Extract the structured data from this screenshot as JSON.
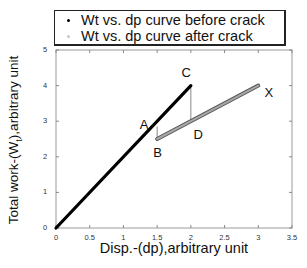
{
  "chart_data": {
    "type": "line",
    "title": "",
    "xlabel": "Disp.-(dp),arbitrary unit",
    "ylabel": "Total work-(Wₜ),arbitrary unit",
    "xlim": [
      0,
      3.5
    ],
    "ylim": [
      0,
      5
    ],
    "xticks": [
      "0",
      "0.5",
      "1",
      "1.5",
      "2",
      "2.5",
      "3",
      "3.5"
    ],
    "yticks": [
      "0",
      "1",
      "2",
      "3",
      "4",
      "5"
    ],
    "grid": false,
    "legend_position": "top, above plot",
    "series": [
      {
        "name": "Wt vs. dp curve before crack",
        "color": "#000000",
        "x": [
          0,
          2.0
        ],
        "y": [
          0,
          4.0
        ]
      },
      {
        "name": "Wt vs. dp curve after crack",
        "color": "#888888",
        "x": [
          1.5,
          3.0
        ],
        "y": [
          2.5,
          4.0
        ]
      }
    ],
    "reference_lines": [
      {
        "name": "B vertical",
        "x": [
          1.5,
          1.5
        ],
        "y": [
          2.5,
          2.85
        ]
      },
      {
        "name": "C-D vertical",
        "x": [
          2.0,
          2.0
        ],
        "y": [
          4.0,
          3.0
        ]
      }
    ],
    "annotations": [
      {
        "text": "A",
        "x": 1.3,
        "y": 2.9
      },
      {
        "text": "B",
        "x": 1.5,
        "y": 2.1
      },
      {
        "text": "C",
        "x": 1.92,
        "y": 4.35
      },
      {
        "text": "D",
        "x": 2.1,
        "y": 2.6
      },
      {
        "text": "X",
        "x": 3.15,
        "y": 3.8
      }
    ]
  },
  "legend": {
    "items": [
      {
        "label": "Wt vs. dp curve before crack",
        "color": "#000000"
      },
      {
        "label": "Wt vs. dp curve after crack",
        "color": "#c8c8c8"
      }
    ]
  },
  "axes": {
    "xlabel": "Disp.-(dp),arbitrary unit",
    "ylabel_main": "Total work-(W",
    "ylabel_sub": "t",
    "ylabel_tail": "),arbitrary unit"
  }
}
